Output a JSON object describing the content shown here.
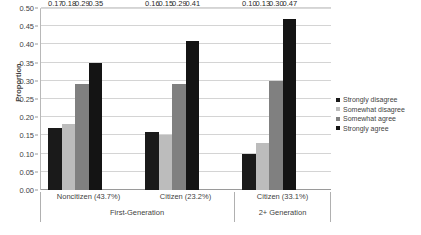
{
  "chart_data": {
    "type": "bar",
    "title": "",
    "xlabel": "",
    "ylabel": "Proportion",
    "ylim": [
      0,
      0.5
    ],
    "ytick_step": 0.05,
    "grid": true,
    "legend_position": "right",
    "categories": [
      "Noncitizen (43.7%)",
      "Citizen (23.2%)",
      "Citizen (33.1%)"
    ],
    "super_categories": [
      "First-Generation",
      "2+ Generation"
    ],
    "super_category_spans": [
      2,
      1
    ],
    "series": [
      {
        "name": "Strongly disagree",
        "color": "#1a1a1a",
        "values": [
          0.17,
          0.16,
          0.1
        ]
      },
      {
        "name": "Somewhat disagree",
        "color": "#bcbcbc",
        "values": [
          0.18,
          0.15,
          0.13
        ]
      },
      {
        "name": "Somewhat agree",
        "color": "#808080",
        "values": [
          0.29,
          0.29,
          0.3
        ]
      },
      {
        "name": "Strongly agree",
        "color": "#141414",
        "values": [
          0.35,
          0.41,
          0.47
        ]
      }
    ],
    "ytick_labels": [
      "0.00",
      "0.05",
      "0.10",
      "0.15",
      "0.20",
      "0.25",
      "0.30",
      "0.35",
      "0.40",
      "0.45",
      "0.50"
    ],
    "data_labels": [
      [
        "0.17",
        "0.18",
        "0.29",
        "0.35"
      ],
      [
        "0.16",
        "0.15",
        "0.29",
        "0.41"
      ],
      [
        "0.10",
        "0.13",
        "0.30",
        "0.47"
      ]
    ]
  },
  "legend": {
    "items": [
      {
        "label": "Strongly disagree"
      },
      {
        "label": "Somewhat disagree"
      },
      {
        "label": "Somewhat agree"
      },
      {
        "label": "Strongly agree"
      }
    ]
  }
}
